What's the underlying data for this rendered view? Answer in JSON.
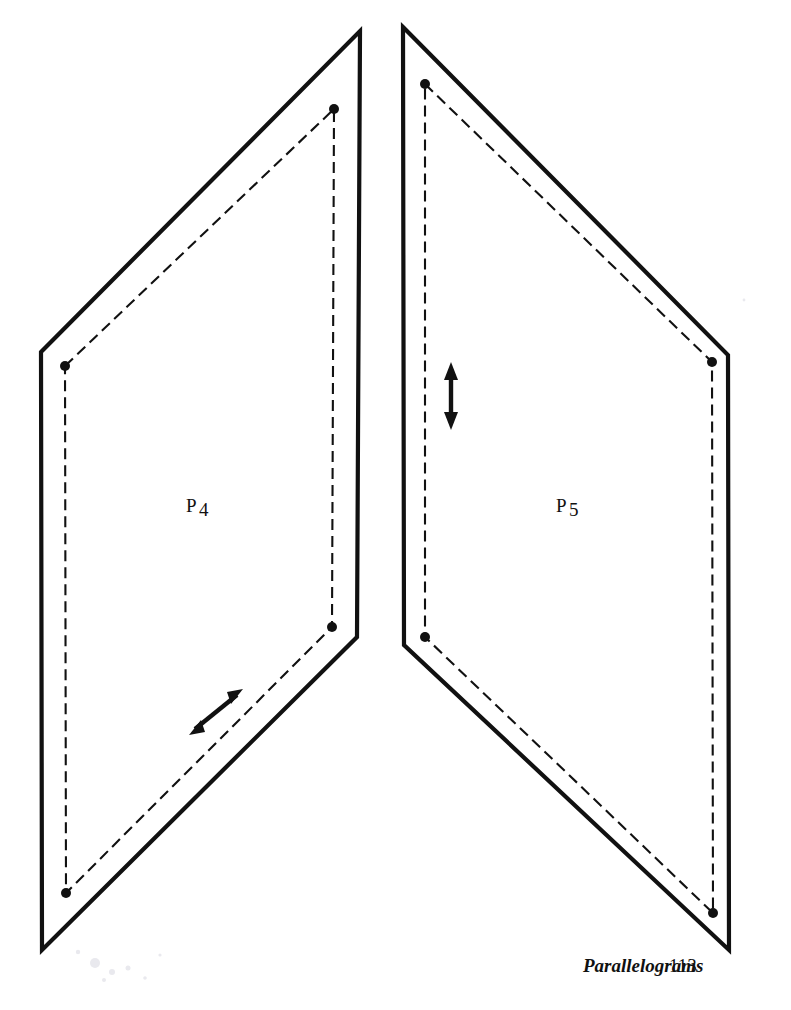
{
  "page": {
    "background_color": "#ffffff",
    "ink_color": "#111111",
    "width": 791,
    "height": 1010
  },
  "figure": {
    "caption_labels": [
      {
        "id": "P4",
        "text": "P4",
        "base": "P",
        "subscript": "4",
        "x": 200,
        "y": 512
      },
      {
        "id": "P5",
        "text": "P5",
        "base": "P",
        "subscript": "5",
        "x": 570,
        "y": 512
      }
    ],
    "shapes": [
      {
        "name": "parallelogram-p4",
        "label": "P4",
        "cut_outline": "41,352 360,31 357,637 42,950",
        "fold_outline": "65,366 334,109 332,627 66,893",
        "corner_dots": [
          {
            "x": 65,
            "y": 366
          },
          {
            "x": 334,
            "y": 109
          },
          {
            "x": 332,
            "y": 627
          },
          {
            "x": 66,
            "y": 893
          }
        ]
      },
      {
        "name": "parallelogram-p5",
        "label": "P5",
        "cut_outline": "403,27 728,355 729,950 404,645",
        "fold_outline": "425,84 712,362 713,913 425,637",
        "corner_dots": [
          {
            "x": 425,
            "y": 84
          },
          {
            "x": 712,
            "y": 362
          },
          {
            "x": 713,
            "y": 913
          },
          {
            "x": 425,
            "y": 637
          }
        ]
      }
    ],
    "arrows": [
      {
        "name": "grain-direction-arrow-p4",
        "orientation": "diagonal",
        "double_headed": true,
        "x1": 189,
        "y1": 735,
        "x2": 243,
        "y2": 689
      },
      {
        "name": "grain-direction-arrow-p5",
        "orientation": "vertical",
        "double_headed": true,
        "x1": 451,
        "y1": 364,
        "x2": 451,
        "y2": 428
      }
    ]
  },
  "footer": {
    "section_title": "Parallelograms",
    "page_number": "113"
  }
}
